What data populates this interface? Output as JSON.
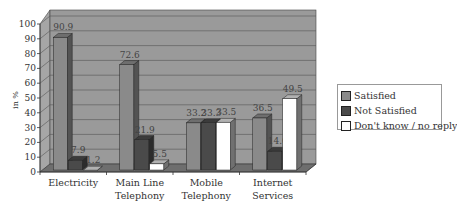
{
  "chart_data": {
    "type": "bar",
    "title": "",
    "xlabel": "",
    "ylabel": "in %",
    "ylim": [
      0,
      100
    ],
    "yticks": [
      0,
      10,
      20,
      30,
      40,
      50,
      60,
      70,
      80,
      90,
      100
    ],
    "grid": true,
    "three_d": true,
    "legend_position": "right",
    "categories": [
      "Electricity",
      "Main Line Telephony",
      "Mobile Telephony",
      "Internet Services"
    ],
    "category_lines": [
      [
        "Electricity"
      ],
      [
        "Main Line",
        "Telephony"
      ],
      [
        "Mobile",
        "Telephony"
      ],
      [
        "Internet",
        "Services"
      ]
    ],
    "series": [
      {
        "name": "Satisfied",
        "values": [
          90.9,
          72.6,
          33.2,
          36.5
        ],
        "labels": [
          "90.9",
          "72.6",
          "33.2",
          "36.5"
        ],
        "color": "#8a8a8a"
      },
      {
        "name": "Not Satisfied",
        "values": [
          7.9,
          21.9,
          33.3,
          14.0
        ],
        "labels": [
          "7.9",
          "21.9",
          "33.3",
          "14.0"
        ],
        "color": "#4a4a4a"
      },
      {
        "name": "Don't know / no reply",
        "values": [
          1.2,
          5.5,
          33.5,
          49.5
        ],
        "labels": [
          "1.2",
          "5.5",
          "33.5",
          "49.5"
        ],
        "color": "#ffffff"
      }
    ]
  },
  "colors": {
    "wall": "#9a9a9a",
    "floor": "#6e6e6e",
    "grid": "#555555"
  }
}
